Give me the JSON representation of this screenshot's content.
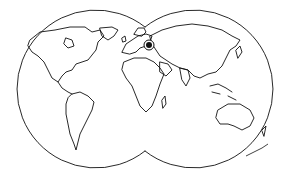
{
  "map": {
    "type": "double-hemisphere world map",
    "style": "black outline on white",
    "hemispheres": [
      {
        "name": "western",
        "cx": 86,
        "cy": 89,
        "r": 79
      },
      {
        "name": "eastern",
        "cx": 203,
        "cy": 89,
        "r": 79
      }
    ],
    "marker": {
      "icon": "target-location-marker",
      "x": 149,
      "y": 45,
      "region": "Eastern Europe"
    },
    "signature": {
      "text": "signature",
      "x": 258,
      "y": 153
    },
    "colors": {
      "line": "#111111",
      "background": "#ffffff"
    }
  }
}
